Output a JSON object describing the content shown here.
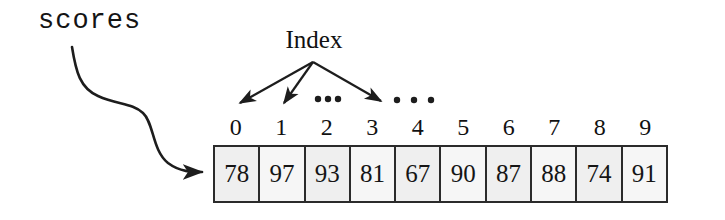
{
  "diagram": {
    "variable_name": "scores",
    "index_caption": "Index",
    "ellipsis_inner": "•••",
    "ellipsis_outer": "• • •",
    "indices": [
      "0",
      "1",
      "2",
      "3",
      "4",
      "5",
      "6",
      "7",
      "8",
      "9"
    ],
    "values": [
      "78",
      "97",
      "93",
      "81",
      "67",
      "90",
      "87",
      "88",
      "74",
      "91"
    ],
    "colors": {
      "ink": "#151515",
      "cell_fill": "#efefef",
      "cell_border": "#2b2b2b",
      "background": "#ffffff"
    }
  }
}
